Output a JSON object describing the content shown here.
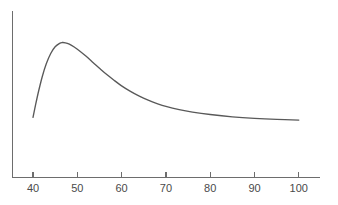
{
  "chart_data": {
    "type": "line",
    "title": "",
    "subtitle": "",
    "xlabel": "",
    "ylabel": "",
    "xlim": [
      35.2,
      103.4
    ],
    "ylim": [
      0,
      1
    ],
    "grid": false,
    "legend": null,
    "xticks": [
      40,
      50,
      60,
      70,
      80,
      90,
      100
    ],
    "xtick_labels": [
      "40",
      "50",
      "60",
      "70",
      "80",
      "90",
      "100"
    ],
    "yticks": [],
    "ytick_labels": [],
    "series": [
      {
        "name": "curve",
        "color": "#595959",
        "x": [
          40.0,
          40.6,
          41.3,
          42.1,
          43.0,
          44.0,
          45.0,
          46.0,
          46.6,
          47.3,
          48.2,
          49.3,
          50.6,
          52.0,
          53.6,
          55.2,
          56.8,
          58.4,
          60.0,
          62.0,
          64.0,
          66.0,
          68.0,
          70.0,
          73.0,
          76.0,
          80.0,
          85.0,
          90.0,
          95.0,
          100.0
        ],
        "y": [
          0.253,
          0.353,
          0.461,
          0.57,
          0.668,
          0.748,
          0.8,
          0.827,
          0.833,
          0.831,
          0.82,
          0.798,
          0.766,
          0.726,
          0.677,
          0.628,
          0.581,
          0.538,
          0.497,
          0.454,
          0.417,
          0.386,
          0.36,
          0.338,
          0.313,
          0.294,
          0.275,
          0.257,
          0.245,
          0.237,
          0.232
        ]
      }
    ]
  },
  "axes": {
    "y_axis_name": "y-axis-line",
    "x_axis_name": "x-axis-line",
    "axis_color": "#6d6d6d"
  },
  "colors": {
    "background": "#ffffff",
    "curve": "#595959",
    "axis": "#6d6d6d",
    "tick_text": "#4a4a4a"
  }
}
